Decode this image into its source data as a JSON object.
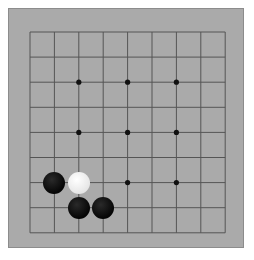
{
  "board": {
    "size": 9,
    "colors": {
      "board": "#aaaaaa",
      "line": "#555555",
      "black": "#0a0a0a",
      "white": "#f4f4f4"
    },
    "star_points": [
      [
        2,
        2
      ],
      [
        4,
        2
      ],
      [
        6,
        2
      ],
      [
        2,
        4
      ],
      [
        4,
        4
      ],
      [
        6,
        4
      ],
      [
        2,
        6
      ],
      [
        4,
        6
      ],
      [
        6,
        6
      ]
    ],
    "stones": [
      {
        "col": 1,
        "row": 6,
        "color": "black"
      },
      {
        "col": 2,
        "row": 6,
        "color": "white"
      },
      {
        "col": 2,
        "row": 7,
        "color": "black"
      },
      {
        "col": 3,
        "row": 7,
        "color": "black"
      }
    ]
  }
}
